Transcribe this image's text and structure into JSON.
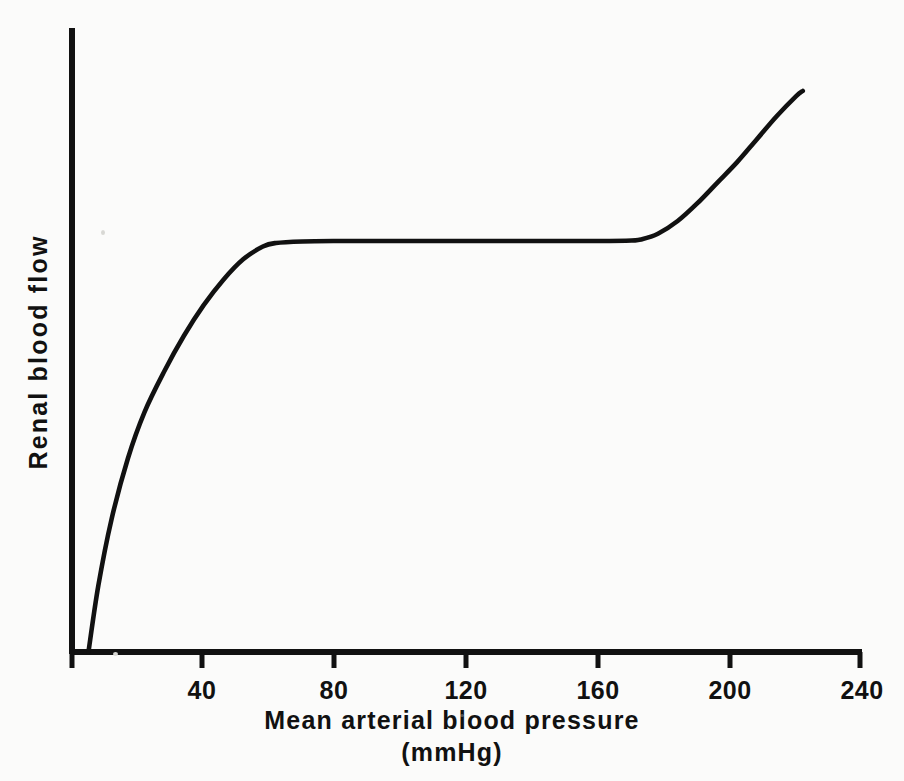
{
  "figure": {
    "background_color": "#fbfbfa",
    "ink_color": "#111111",
    "width": 904,
    "height": 781
  },
  "axes": {
    "y_axis_title": "Renal blood flow",
    "x_axis_title": "Mean arterial blood pressure",
    "x_axis_unit": "(mmHg)"
  },
  "ticks": {
    "x": [
      {
        "label": "40",
        "value": 40,
        "px": 202
      },
      {
        "label": "80",
        "value": 80,
        "px": 334
      },
      {
        "label": "120",
        "value": 120,
        "px": 466
      },
      {
        "label": "160",
        "value": 160,
        "px": 598
      },
      {
        "label": "200",
        "value": 200,
        "px": 730
      },
      {
        "label": "240",
        "value": 240,
        "px": 862
      }
    ]
  },
  "chart_data": {
    "type": "line",
    "title": "",
    "subtitle": "",
    "xlabel": "Mean arterial blood pressure (mmHg)",
    "ylabel": "Renal blood flow",
    "xlim": [
      0,
      240
    ],
    "ylim": [
      0,
      100
    ],
    "grid": false,
    "legend": false,
    "legend_position": "none",
    "xticks": [
      40,
      80,
      120,
      160,
      200,
      240
    ],
    "xticklabels": [
      "40",
      "80",
      "120",
      "160",
      "200",
      "240"
    ],
    "yticks": [],
    "yticklabels": [],
    "annotations": [],
    "series": [
      {
        "name": "Renal blood flow autoregulation curve",
        "x": [
          5,
          8,
          12,
          17,
          22,
          28,
          34,
          40,
          46,
          52,
          58,
          62,
          70,
          80,
          90,
          100,
          110,
          120,
          130,
          140,
          150,
          160,
          170,
          173,
          178,
          184,
          190,
          196,
          202,
          208,
          214,
          220,
          222
        ],
        "y": [
          0,
          13,
          26,
          38,
          47,
          55,
          62,
          68,
          73,
          77,
          79.5,
          80.2,
          80.5,
          80.6,
          80.6,
          80.6,
          80.6,
          80.6,
          80.6,
          80.6,
          80.6,
          80.6,
          80.7,
          80.9,
          82,
          84.5,
          88,
          92,
          96,
          100.5,
          105,
          109,
          110
        ]
      }
    ]
  }
}
